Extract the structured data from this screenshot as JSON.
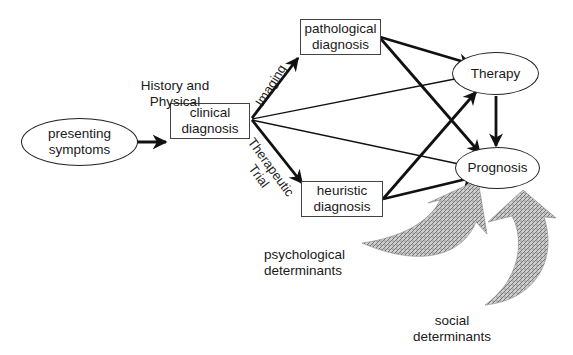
{
  "nodes": {
    "presenting_symptoms": {
      "line1": "presenting",
      "line2": "symptoms"
    },
    "clinical_diagnosis": {
      "line1": "clinical",
      "line2": "diagnosis"
    },
    "pathological_diagnosis": {
      "line1": "pathological",
      "line2": "diagnosis"
    },
    "heuristic_diagnosis": {
      "line1": "heuristic",
      "line2": "diagnosis"
    },
    "therapy": {
      "label": "Therapy"
    },
    "prognosis": {
      "label": "Prognosis"
    }
  },
  "edge_labels": {
    "history_physical": {
      "line1": "History and",
      "line2": "Physical"
    },
    "imaging": "Imaging",
    "therapeutic_trial": {
      "line1": "Therapeutic",
      "line2": "Trial"
    }
  },
  "influences": {
    "psychological": {
      "line1": "psychological",
      "line2": "determinants"
    },
    "social": {
      "line1": "social",
      "line2": "determinants"
    }
  },
  "colors": {
    "stroke": "#111111",
    "box_border": "#444444",
    "hatch": "#8a8a8a",
    "background": "#ffffff"
  }
}
